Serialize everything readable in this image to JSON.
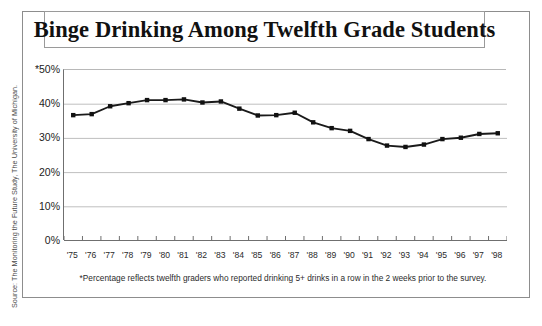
{
  "source_note": "Source: The Monitoring the Future Study, The University of Michigan.",
  "title": "Binge Drinking Among Twelfth Grade Students",
  "footnote": "*Percentage reflects twelfth graders who reported drinking 5+ drinks in a row in the 2 weeks prior to the survey.",
  "colors": {
    "line": "#1a1a1a",
    "marker": "#111111",
    "grid": "#bfbfbf",
    "axis": "#6f6f6f",
    "frame": "#8d8d8d",
    "text": "#1c1c1c"
  },
  "chart_data": {
    "type": "line",
    "title": "Binge Drinking Among Twelfth Grade Students",
    "xlabel": "",
    "ylabel": "",
    "ylim": [
      0,
      50
    ],
    "yticks": [
      0,
      10,
      20,
      30,
      40,
      50
    ],
    "ytick_labels": [
      "0%",
      "10%",
      "20%",
      "30%",
      "40%",
      "*50%"
    ],
    "grid": true,
    "legend": "none",
    "categories": [
      "'75",
      "'76",
      "'77",
      "'78",
      "'79",
      "'80",
      "'81",
      "'82",
      "'83",
      "'84",
      "'85",
      "'86",
      "'87",
      "'88",
      "'89",
      "'90",
      "'91",
      "'92",
      "'93",
      "'94",
      "'95",
      "'96",
      "'97",
      "'98"
    ],
    "values": [
      36.8,
      37.1,
      39.4,
      40.3,
      41.2,
      41.2,
      41.4,
      40.5,
      40.8,
      38.7,
      36.7,
      36.8,
      37.5,
      34.7,
      33.0,
      32.2,
      29.8,
      27.9,
      27.5,
      28.2,
      29.8,
      30.2,
      31.3,
      31.5
    ],
    "series_name": "Binge drinking rate",
    "annotations": [
      "*Percentage reflects twelfth graders who reported drinking 5+ drinks in a row in the 2 weeks prior to the survey."
    ]
  }
}
